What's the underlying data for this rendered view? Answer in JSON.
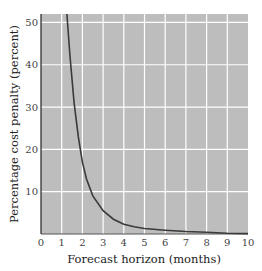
{
  "chart_data": {
    "type": "line",
    "title": "",
    "xlabel": "Forecast horizon (months)",
    "ylabel": "Percentage cost penalty (percent)",
    "xlim": [
      0,
      10
    ],
    "ylim": [
      0,
      52
    ],
    "x_ticks": [
      "0",
      "1",
      "2",
      "3",
      "4",
      "5",
      "6",
      "7",
      "8",
      "9",
      "10"
    ],
    "y_ticks": [
      "10",
      "20",
      "30",
      "40",
      "50"
    ],
    "grid": true,
    "legend": null,
    "series": [
      {
        "name": "cost penalty",
        "x": [
          1.25,
          1.4,
          1.6,
          1.8,
          2.0,
          2.2,
          2.5,
          3.0,
          3.5,
          4.0,
          4.5,
          5.0,
          6.0,
          7.0,
          8.0,
          9.0,
          10.0
        ],
        "values": [
          52,
          42,
          31,
          23,
          17,
          13,
          9,
          5.5,
          3.5,
          2.3,
          1.7,
          1.3,
          0.9,
          0.6,
          0.4,
          0.2,
          0.1
        ]
      }
    ],
    "colors": {
      "plot_bg": "#bdbdbd",
      "grid": "#ffffff",
      "line": "#3a3a3a"
    }
  }
}
